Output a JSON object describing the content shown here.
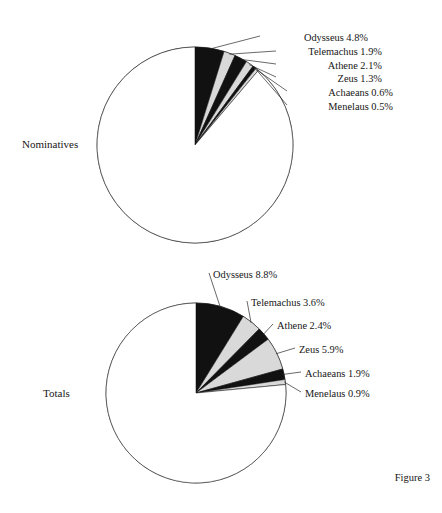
{
  "figure": {
    "caption": "Figure 3",
    "background_color": "#ffffff",
    "text_color": "#161616"
  },
  "colors": {
    "slice_dark": "#111111",
    "slice_light": "#d9d9d9",
    "slice_remainder": "#ffffff",
    "outline": "#555555",
    "leader_line": "#2a2a2a"
  },
  "rows": [
    {
      "label": "Nominatives"
    },
    {
      "label": "Totals"
    }
  ],
  "chart_data": [
    {
      "type": "pie",
      "title": "Nominatives",
      "categories": [
        "Odysseus",
        "Telemachus",
        "Athene",
        "Zeus",
        "Achaeans",
        "Menelaus",
        "Other"
      ],
      "values": [
        4.8,
        1.9,
        2.1,
        1.3,
        0.6,
        0.5,
        88.8
      ],
      "unit": "%",
      "start_angle_deg": 0,
      "direction": "clockwise",
      "labels": [
        {
          "name": "Odysseus",
          "value": 4.8,
          "text": "Odysseus 4.8%",
          "fill": "dark"
        },
        {
          "name": "Telemachus",
          "value": 1.9,
          "text": "Telemachus 1.9%",
          "fill": "light"
        },
        {
          "name": "Athene",
          "value": 2.1,
          "text": "Athene 2.1%",
          "fill": "dark"
        },
        {
          "name": "Zeus",
          "value": 1.3,
          "text": "Zeus 1.3%",
          "fill": "light"
        },
        {
          "name": "Achaeans",
          "value": 0.6,
          "text": "Achaeans 0.6%",
          "fill": "dark"
        },
        {
          "name": "Menelaus",
          "value": 0.5,
          "text": "Menelaus 0.5%",
          "fill": "light"
        }
      ],
      "legend_position": "callout-labels",
      "grid": false
    },
    {
      "type": "pie",
      "title": "Totals",
      "categories": [
        "Odysseus",
        "Telemachus",
        "Athene",
        "Zeus",
        "Achaeans",
        "Menelaus",
        "Other"
      ],
      "values": [
        8.8,
        3.6,
        2.4,
        5.9,
        1.9,
        0.9,
        76.5
      ],
      "unit": "%",
      "start_angle_deg": 0,
      "direction": "clockwise",
      "labels": [
        {
          "name": "Odysseus",
          "value": 8.8,
          "text": "Odysseus 8.8%",
          "fill": "dark"
        },
        {
          "name": "Telemachus",
          "value": 3.6,
          "text": "Telemachus 3.6%",
          "fill": "light"
        },
        {
          "name": "Athene",
          "value": 2.4,
          "text": "Athene 2.4%",
          "fill": "dark"
        },
        {
          "name": "Zeus",
          "value": 5.9,
          "text": "Zeus 5.9%",
          "fill": "light"
        },
        {
          "name": "Achaeans",
          "value": 1.9,
          "text": "Achaeans 1.9%",
          "fill": "dark"
        },
        {
          "name": "Menelaus",
          "value": 0.9,
          "text": "Menelaus 0.9%",
          "fill": "light"
        }
      ],
      "legend_position": "callout-labels",
      "grid": false
    }
  ]
}
